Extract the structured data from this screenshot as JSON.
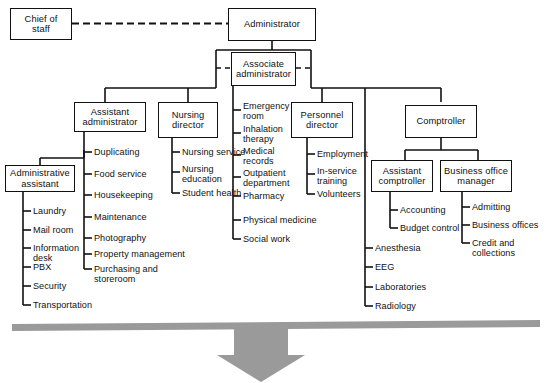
{
  "diagram": {
    "colors": {
      "line": "#111111",
      "box_border": "#111111",
      "background": "#ffffff",
      "arrow_fill": "#9a9a9a",
      "bar_fill": "#9a9a9a"
    }
  },
  "nodes": {
    "chief_of_staff": {
      "label": "Chief of\nstaff"
    },
    "administrator": {
      "label": "Administrator"
    },
    "associate_administrator": {
      "label": "Associate\nadministrator"
    },
    "assistant_administrator": {
      "label": "Assistant\nadministrator"
    },
    "nursing_director": {
      "label": "Nursing\ndirector"
    },
    "personnel_director": {
      "label": "Personnel\ndirector"
    },
    "comptroller": {
      "label": "Comptroller"
    },
    "administrative_assistant": {
      "label": "Administrative\nassistant"
    },
    "assistant_comptroller": {
      "label": "Assistant\ncomptroller"
    },
    "business_office_manager": {
      "label": "Business office\nmanager"
    }
  },
  "leaves": {
    "administrative_assistant": [
      {
        "label": "Laundry"
      },
      {
        "label": "Mail room"
      },
      {
        "label": "Information\ndesk"
      },
      {
        "label": "PBX"
      },
      {
        "label": "Security"
      },
      {
        "label": "Transportation"
      }
    ],
    "assistant_administrator": [
      {
        "label": "Duplicating"
      },
      {
        "label": "Food service"
      },
      {
        "label": "Housekeeping"
      },
      {
        "label": "Maintenance"
      },
      {
        "label": "Photography"
      },
      {
        "label": "Property management"
      },
      {
        "label": "Purchasing and\n   storeroom"
      }
    ],
    "nursing_director": [
      {
        "label": "Nursing service"
      },
      {
        "label": "Nursing\neducation"
      },
      {
        "label": "Student health"
      }
    ],
    "associate_administrator": [
      {
        "label": "Emergency\nroom"
      },
      {
        "label": "Inhalation\ntherapy"
      },
      {
        "label": "Medical\nrecords"
      },
      {
        "label": "Outpatient\ndepartment"
      },
      {
        "label": "Pharmacy"
      },
      {
        "label": "Physical medicine"
      },
      {
        "label": "Social work"
      }
    ],
    "personnel_director": [
      {
        "label": "Employment"
      },
      {
        "label": "In-service\ntraining"
      },
      {
        "label": "Volunteers"
      }
    ],
    "medical_services": [
      {
        "label": "Anesthesia"
      },
      {
        "label": "EEG"
      },
      {
        "label": "Laboratories"
      },
      {
        "label": "Radiology"
      }
    ],
    "assistant_comptroller": [
      {
        "label": "Accounting"
      },
      {
        "label": "Budget control"
      }
    ],
    "business_office_manager": [
      {
        "label": "Admitting"
      },
      {
        "label": "Business offices"
      },
      {
        "label": "Credit and collections"
      }
    ]
  }
}
